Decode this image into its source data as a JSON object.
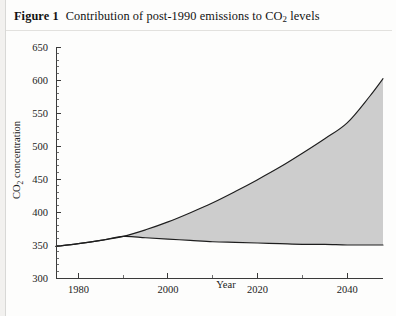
{
  "caption": {
    "figure_label": "Figure 1",
    "text_before_sub": "Contribution of post-1990 emissions to CO",
    "subscript": "2",
    "text_after_sub": " levels"
  },
  "chart_data": {
    "type": "area",
    "title": "Contribution of post-1990 emissions to CO2 levels",
    "xlabel": "Year",
    "ylabel": "CO2 concentration",
    "ylabel_before_sub": "CO",
    "ylabel_sub": "2",
    "ylabel_after_sub": " concentration",
    "xlim": [
      1975,
      2048
    ],
    "ylim": [
      300,
      650
    ],
    "x_ticks_major": [
      1980,
      2000,
      2020,
      2040
    ],
    "x_ticks_minor": [
      1990,
      2010,
      2030
    ],
    "x_tick_labels": [
      "1980",
      "2000",
      "2020",
      "2040"
    ],
    "y_ticks_major": [
      300,
      350,
      400,
      450,
      500,
      550,
      600,
      650
    ],
    "y_tick_labels": [
      "300",
      "350",
      "400",
      "450",
      "500",
      "550",
      "600",
      "650"
    ],
    "y_ticks_minor": [
      310,
      320,
      330,
      340,
      360,
      370,
      380,
      390,
      410,
      420,
      430,
      440,
      460,
      470,
      480,
      490,
      510,
      520,
      530,
      540,
      560,
      570,
      580,
      590,
      610,
      620,
      630,
      640
    ],
    "grid": false,
    "legend": null,
    "shaded_region_color": "#cdcdcd",
    "line_color": "#1e1e1e",
    "divergence_year": 1990,
    "series": [
      {
        "name": "Concentration with post-1990 emissions",
        "x": [
          1975,
          1980,
          1985,
          1990,
          1995,
          2000,
          2005,
          2010,
          2015,
          2020,
          2025,
          2030,
          2035,
          2040,
          2045,
          2048
        ],
        "values": [
          348,
          352,
          357,
          363,
          373,
          385,
          399,
          414,
          431,
          449,
          468,
          489,
          511,
          535,
          575,
          602
        ]
      },
      {
        "name": "Concentration without post-1990 emissions",
        "x": [
          1975,
          1980,
          1985,
          1990,
          1995,
          2000,
          2005,
          2010,
          2015,
          2020,
          2025,
          2030,
          2035,
          2040,
          2045,
          2048
        ],
        "values": [
          348,
          352,
          357,
          363,
          361,
          359,
          357,
          355,
          354,
          353,
          352,
          351,
          351,
          350,
          350,
          350
        ]
      }
    ]
  }
}
